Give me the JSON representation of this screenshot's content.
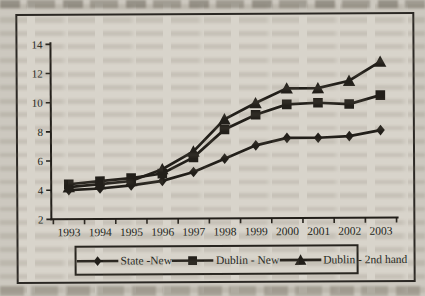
{
  "colors": {
    "paper": "#ccc8bf",
    "chart_background": "#d8d4cb",
    "ink": "#221f1a",
    "frame_border": "#2b2824",
    "ghost_text": "#746c5d"
  },
  "chart_data": {
    "type": "line",
    "title": "",
    "xlabel": "",
    "ylabel": "",
    "categories": [
      "1993",
      "1994",
      "1995",
      "1996",
      "1997",
      "1998",
      "1999",
      "2000",
      "2001",
      "2002",
      "2003"
    ],
    "series": [
      {
        "name": "State -New",
        "marker": "diamond",
        "values": [
          4.0,
          4.1,
          4.3,
          4.6,
          5.2,
          6.1,
          7.0,
          7.5,
          7.5,
          7.6,
          8.0
        ]
      },
      {
        "name": "Dublin - New",
        "marker": "square",
        "values": [
          4.4,
          4.6,
          4.8,
          5.1,
          6.2,
          8.1,
          9.1,
          9.8,
          9.9,
          9.8,
          10.4
        ]
      },
      {
        "name": "Dublin - 2nd hand",
        "marker": "triangle",
        "values": [
          4.2,
          4.4,
          4.6,
          5.4,
          6.6,
          8.8,
          9.9,
          10.9,
          10.9,
          11.4,
          12.7
        ]
      }
    ],
    "ylim": [
      2,
      14
    ],
    "yticks": [
      2,
      4,
      6,
      8,
      10,
      12,
      14
    ],
    "grid": false,
    "legend_position": "bottom",
    "line_color": "#221f1a",
    "marker_color": "#221f1a"
  }
}
